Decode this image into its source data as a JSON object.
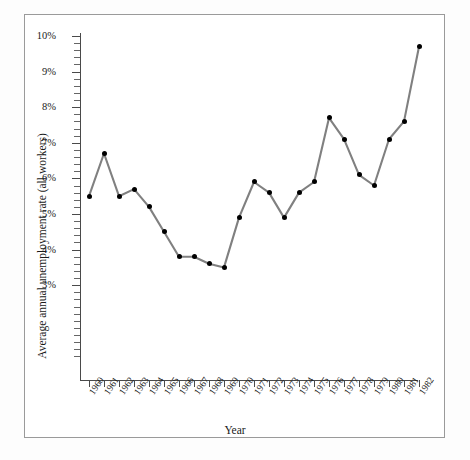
{
  "chart_data": {
    "type": "line",
    "title": "",
    "xlabel": "Year",
    "ylabel": "Average annual unemployment rate (all workers)",
    "categories": [
      "1960",
      "1961",
      "1962",
      "1963",
      "1964",
      "1965",
      "1966",
      "1967",
      "1968",
      "1969",
      "1970",
      "1971",
      "1972",
      "1973",
      "1974",
      "1975",
      "1976",
      "1977",
      "1978",
      "1979",
      "1980",
      "1981",
      "1982"
    ],
    "values": [
      5.5,
      6.7,
      5.5,
      5.7,
      5.2,
      4.5,
      3.8,
      3.8,
      3.6,
      3.5,
      4.9,
      5.9,
      5.6,
      4.9,
      5.6,
      5.9,
      7.7,
      7.1,
      6.1,
      5.8,
      7.1,
      7.6,
      9.7
    ],
    "ylim": [
      3,
      10
    ],
    "y_tick_labels": [
      "10%",
      "9%",
      "8%",
      "7%",
      "6%",
      "5%",
      "4%",
      "3%"
    ],
    "y_tick_values": [
      10,
      9,
      8,
      7,
      6,
      5,
      4,
      3
    ],
    "y_minor_step": 0.2,
    "grid": false,
    "legend": "none",
    "line_color": "#808080",
    "marker_color": "#000000",
    "axis_color": "#4a4a4a",
    "background_color": "#ffffff",
    "border_color": "#9a9a9a"
  }
}
